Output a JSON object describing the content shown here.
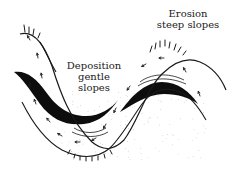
{
  "diagram": {
    "type": "geomorphology-fold-cross-section",
    "labels": {
      "erosion": {
        "line1": "Erosion",
        "line2": "steep slopes"
      },
      "deposition": {
        "line1": "Deposition",
        "line2": "gentle",
        "line3": "slopes"
      }
    },
    "colors": {
      "ink": "#1a1a1a",
      "deposit_fill": "#0d0d0d",
      "stipple": "#9a9a9a",
      "background": "#ffffff"
    },
    "elements": [
      "outer-surface-curve",
      "inner-surface-curve",
      "deposition-band-syncline",
      "deposition-band-anticline",
      "erosion-hachures",
      "flow-arrows",
      "stipple-fill"
    ]
  }
}
